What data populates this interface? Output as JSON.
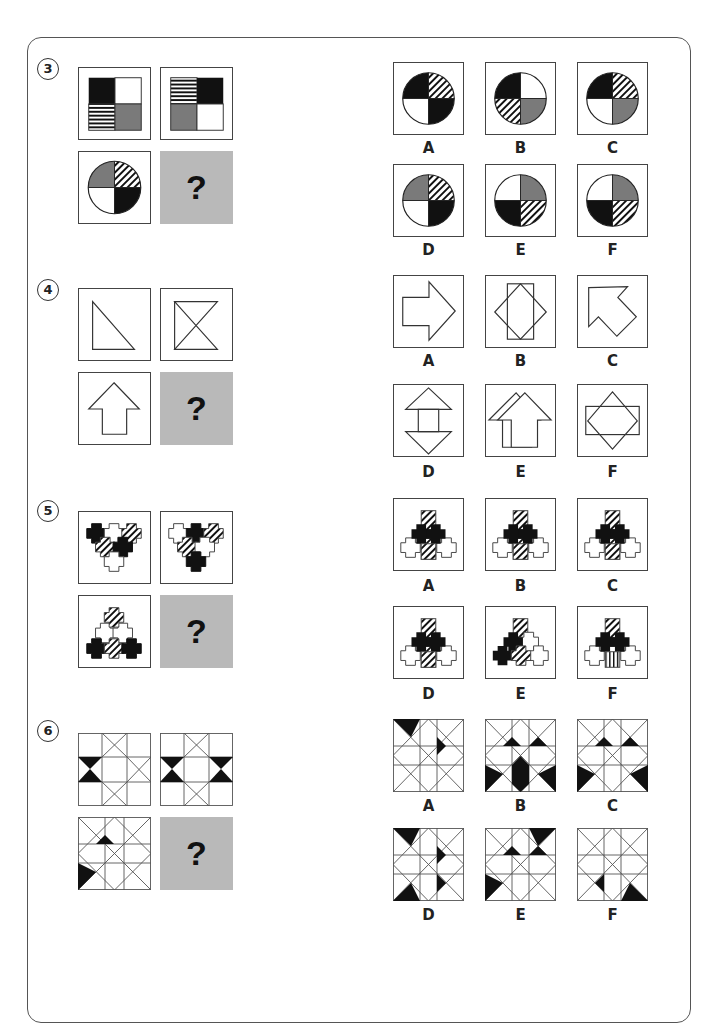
{
  "page": {
    "type": "visual reasoning test (matrices)",
    "question_mark": "?",
    "colors": {
      "black": "#111111",
      "grey": "#7a7a7a",
      "placeholder_bg": "#b9b9b9",
      "border": "#444444"
    }
  },
  "questions": [
    {
      "number": "3",
      "matrix": [
        "square quadrants: black TL, white TR, horizontal-stripes BL, grey BR",
        "square quadrants: stripes TL, black TR, grey BL, white BR",
        "circle quadrants: grey TL, diagonal-hatch TR, white BL, black BR",
        "?"
      ],
      "options": [
        {
          "label": "A",
          "desc": "circle: black TL, hatch TR, white BL, black BR"
        },
        {
          "label": "B",
          "desc": "circle: black TL, white TR, hatch BL, grey BR"
        },
        {
          "label": "C",
          "desc": "circle: black TL, hatch TR, white BL, grey BR"
        },
        {
          "label": "D",
          "desc": "circle: grey TL, hatch TR, white BL, black BR"
        },
        {
          "label": "E",
          "desc": "circle: white TL, grey TR, black BL, hatch BR"
        },
        {
          "label": "F",
          "desc": "circle: white TL, grey TR, black BL, hatch BR"
        }
      ]
    },
    {
      "number": "4",
      "matrix": [
        "right triangle",
        "hourglass (two triangles in X)",
        "up arrow",
        "?"
      ],
      "options": [
        {
          "label": "A",
          "desc": "right arrow"
        },
        {
          "label": "B",
          "desc": "rectangle over diamond"
        },
        {
          "label": "C",
          "desc": "arrow pointing up-left"
        },
        {
          "label": "D",
          "desc": "double arrow up and down"
        },
        {
          "label": "E",
          "desc": "two overlapping up arrows"
        },
        {
          "label": "F",
          "desc": "wide rectangle over diamond"
        }
      ]
    },
    {
      "number": "5",
      "matrix": [
        "five crosses triangle arrangement (black, white, hatched)",
        "five crosses inverted triangle",
        "crosses pyramid: hatched top, black corners",
        "?"
      ],
      "options": [
        {
          "label": "A",
          "desc": "hatched top, black middle pair, hatched centre bottom, white sides"
        },
        {
          "label": "B",
          "desc": "variant of A"
        },
        {
          "label": "C",
          "desc": "variant of A"
        },
        {
          "label": "D",
          "desc": "variant of A"
        },
        {
          "label": "E",
          "desc": "black diagonal left, white right"
        },
        {
          "label": "F",
          "desc": "vertical-striped centre bottom"
        }
      ]
    },
    {
      "number": "6",
      "matrix": [
        "3x3 grid with X cells, black bowtie left",
        "3x3 grid, black bowties left and right",
        "rotated grid with two black triangles",
        "?"
      ],
      "options": [
        {
          "label": "A",
          "desc": "black triangles top-left"
        },
        {
          "label": "B",
          "desc": "black triangles bottom row and middle"
        },
        {
          "label": "C",
          "desc": "black triangles bottom corners"
        },
        {
          "label": "D",
          "desc": "black triangles corners left"
        },
        {
          "label": "E",
          "desc": "black triangles top-right and left"
        },
        {
          "label": "F",
          "desc": "black triangles bottom-right"
        }
      ]
    }
  ]
}
